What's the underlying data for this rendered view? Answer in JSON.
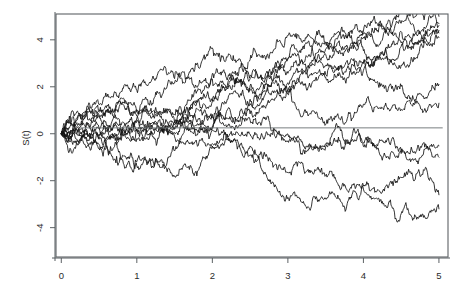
{
  "figure": {
    "background_color": "#ffffff",
    "frame_color": "#5d6265",
    "line_color": "#121212",
    "reference_line_color": "#6a6f72"
  },
  "chart_data": {
    "type": "line",
    "title": "",
    "subtitle": "",
    "xlabel": "",
    "ylabel": "S(t)",
    "xlim": [
      -0.07,
      5.12
    ],
    "ylim": [
      -5.25,
      5.1
    ],
    "xticks": [
      0,
      1,
      2,
      3,
      4,
      5
    ],
    "xticklabels": [
      "0",
      "1",
      "2",
      "3",
      "4",
      "5"
    ],
    "yticks": [
      -4,
      -2,
      0,
      2,
      4
    ],
    "yticklabels": [
      "-4",
      "-2",
      "0",
      "2",
      "4"
    ],
    "grid": false,
    "legend": "none",
    "annotations": [
      {
        "kind": "horizontal-reference-line",
        "y": 0.25,
        "x_start": 0.25,
        "x_end": 5.05
      }
    ],
    "n_series": 12,
    "x_start": 0,
    "x_end": 5,
    "start_value": 0,
    "series": [
      {
        "name": "path-1",
        "seed": 11,
        "drift": 0.92,
        "final_value": 5.0
      },
      {
        "name": "path-2",
        "seed": 27,
        "drift": 0.86,
        "final_value": 4.7
      },
      {
        "name": "path-3",
        "seed": 43,
        "drift": 0.8,
        "final_value": 4.6
      },
      {
        "name": "path-4",
        "seed": 58,
        "drift": 0.72,
        "final_value": 4.3
      },
      {
        "name": "path-5",
        "seed": 71,
        "drift": 0.62,
        "final_value": 4.1
      },
      {
        "name": "path-6",
        "seed": 89,
        "drift": 0.5,
        "final_value": 2.1
      },
      {
        "name": "path-7",
        "seed": 104,
        "drift": 0.4,
        "final_value": 1.3
      },
      {
        "name": "path-8",
        "seed": 122,
        "drift": 0.3,
        "final_value": 4.4
      },
      {
        "name": "path-9",
        "seed": 139,
        "drift": -0.05,
        "final_value": -0.5
      },
      {
        "name": "path-10",
        "seed": 153,
        "drift": -0.22,
        "final_value": -1.0
      },
      {
        "name": "path-11",
        "seed": 168,
        "drift": -0.55,
        "final_value": -2.6
      },
      {
        "name": "path-12",
        "seed": 181,
        "drift": -0.78,
        "final_value": -3.2
      }
    ]
  }
}
